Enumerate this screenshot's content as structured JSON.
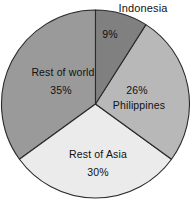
{
  "figure": {
    "background_color": "#ffffff",
    "outline_color": "#2b2b2b"
  },
  "chart_data": {
    "type": "pie",
    "title": "",
    "subtitle": "",
    "xlabel": "",
    "ylabel": "",
    "grid": false,
    "legend_position": "none",
    "label_mode": "inline-on-slice",
    "start_angle_deg": 0,
    "direction": "clockwise",
    "units": "percent",
    "total": 100,
    "categories": [
      "Indonesia",
      "Philippines",
      "Rest of Asia",
      "Rest of world"
    ],
    "values": [
      9,
      26,
      30,
      35
    ],
    "value_labels": [
      "9%",
      "26%",
      "30%",
      "35%"
    ],
    "colors": [
      "#808080",
      "#b8b8b8",
      "#ebebeb",
      "#9a9a9a"
    ],
    "slices": [
      {
        "name": "Indonesia",
        "value": 9,
        "value_label": "9%",
        "name_label": "Indonesia",
        "color": "#808080",
        "start_angle_deg": 0,
        "end_angle_deg": 32.4,
        "label_placement": "name-outside-value-inside"
      },
      {
        "name": "Philippines",
        "value": 26,
        "value_label": "26%",
        "name_label": "Philippines",
        "color": "#b8b8b8",
        "start_angle_deg": 32.4,
        "end_angle_deg": 126.0,
        "label_placement": "inside"
      },
      {
        "name": "Rest of Asia",
        "value": 30,
        "value_label": "30%",
        "name_label": "Rest of Asia",
        "color": "#ebebeb",
        "start_angle_deg": 126.0,
        "end_angle_deg": 234.0,
        "label_placement": "inside"
      },
      {
        "name": "Rest of world",
        "value": 35,
        "value_label": "35%",
        "name_label": "Rest of world",
        "color": "#9a9a9a",
        "start_angle_deg": 234.0,
        "end_angle_deg": 360.0,
        "label_placement": "inside"
      }
    ]
  },
  "labels": {
    "indonesia_name": "Indonesia",
    "indonesia_value": "9%",
    "philippines_value": "26%",
    "philippines_name": "Philippines",
    "rest_of_asia_name": "Rest of Asia",
    "rest_of_asia_value": "30%",
    "rest_of_world_name": "Rest of world",
    "rest_of_world_value": "35%"
  }
}
